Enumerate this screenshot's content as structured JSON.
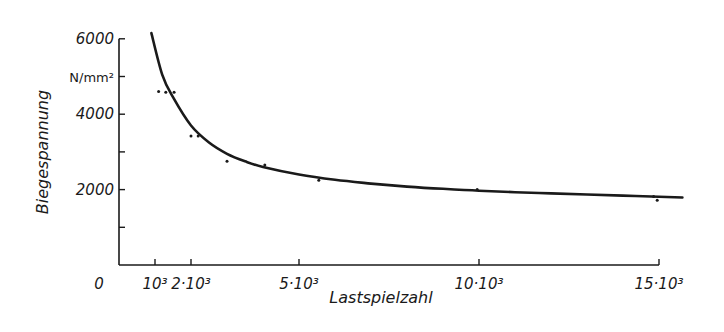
{
  "chart_data": {
    "type": "line",
    "title": "",
    "xlabel": "Lastspielzahl",
    "ylabel": "Biegespannung",
    "y_unit": "N/mm²",
    "xlim": [
      0,
      15700
    ],
    "ylim": [
      0,
      6000
    ],
    "grid": false,
    "legend": null,
    "x_ticks": [
      {
        "value": 0,
        "label": "0"
      },
      {
        "value": 1000,
        "label": "10³"
      },
      {
        "value": 2000,
        "label": "2·10³"
      },
      {
        "value": 5000,
        "label": "5·10³"
      },
      {
        "value": 10000,
        "label": "10·10³"
      },
      {
        "value": 15000,
        "label": "15·10³"
      }
    ],
    "y_ticks": [
      {
        "value": 1000,
        "label": ""
      },
      {
        "value": 2000,
        "label": "2000"
      },
      {
        "value": 3000,
        "label": ""
      },
      {
        "value": 4000,
        "label": "4000"
      },
      {
        "value": 5000,
        "label": "N/mm²"
      },
      {
        "value": 6000,
        "label": "6000"
      }
    ],
    "series": [
      {
        "name": "Wöhler curve (fit)",
        "style": "line",
        "x": [
          900,
          1200,
          1500,
          2000,
          2500,
          3000,
          3500,
          4000,
          5000,
          6000,
          7000,
          8000,
          9000,
          10000,
          11000,
          12000,
          13000,
          14000,
          15000,
          15650
        ],
        "y": [
          6150,
          5050,
          4450,
          3700,
          3250,
          2950,
          2750,
          2600,
          2400,
          2260,
          2160,
          2080,
          2020,
          1970,
          1930,
          1900,
          1870,
          1840,
          1810,
          1790
        ]
      },
      {
        "name": "Measured points",
        "style": "scatter",
        "x": [
          1100,
          1300,
          1530,
          2000,
          2200,
          3000,
          4050,
          5550,
          9950,
          14850,
          14950
        ],
        "y": [
          4600,
          4580,
          4580,
          3420,
          3420,
          2750,
          2650,
          2250,
          2000,
          1820,
          1720
        ]
      }
    ]
  }
}
